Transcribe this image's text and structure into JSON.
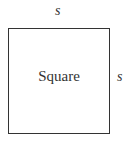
{
  "diagram": {
    "shape": "square",
    "name_label": "Square",
    "top_side_label": "s",
    "right_side_label": "s"
  }
}
